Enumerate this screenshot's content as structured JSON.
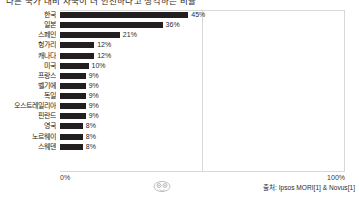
{
  "chart_data": {
    "type": "bar",
    "orientation": "horizontal",
    "title": "다른 국가 대비 자국이 더 안전하다고 생각하는 비율",
    "xlabel": "",
    "ylabel": "",
    "xlim": [
      0,
      100
    ],
    "xticks": [
      "0%",
      "100%"
    ],
    "grid": true,
    "gridlines_at": [
      50
    ],
    "legend": "none",
    "categories": [
      "한국",
      "일본",
      "스페인",
      "헝가리",
      "캐나다",
      "미국",
      "프랑스",
      "벨기에",
      "독일",
      "오스트레일리아",
      "핀란드",
      "영국",
      "노르웨이",
      "스웨덴"
    ],
    "values": [
      45,
      36,
      21,
      12,
      12,
      10,
      9,
      9,
      9,
      9,
      9,
      8,
      8,
      8
    ],
    "data_labels": [
      "45%",
      "36%",
      "21%",
      "12%",
      "12%",
      "10%",
      "9%",
      "9%",
      "9%",
      "9%",
      "9%",
      "8%",
      "8%",
      "8%"
    ],
    "bar_color": "#231f20",
    "source": "출처: Ipsos MORI[1] & Novus[1]"
  },
  "axis": {
    "min_label": "0%",
    "max_label": "100%"
  },
  "footer": {
    "source_text": "출처: Ipsos MORI[1] & Novus[1]",
    "watermark_name": "owl-watermark-icon"
  }
}
